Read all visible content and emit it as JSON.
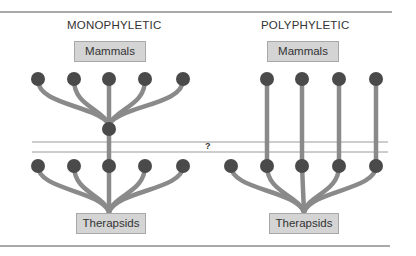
{
  "left": {
    "title": "MONOPHYLETIC",
    "top_label": "Mammals",
    "bottom_label": "Therapsids"
  },
  "right": {
    "title": "POLYPHYLETIC",
    "top_label": "Mammals",
    "bottom_label": "Therapsids"
  },
  "divider": {
    "label": "?"
  },
  "colors": {
    "branch": "#8a8a8a",
    "node": "#4a4a4a",
    "box": "#d4d4d4",
    "line": "#8c8c8c"
  }
}
